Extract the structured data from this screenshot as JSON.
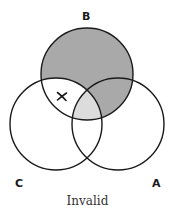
{
  "diagram": {
    "type": "venn-3-set",
    "caption": "Invalid",
    "sets": [
      {
        "id": "A",
        "label": "A",
        "cx": 118,
        "cy": 124,
        "r": 46
      },
      {
        "id": "B",
        "label": "B",
        "cx": 87,
        "cy": 74,
        "r": 46
      },
      {
        "id": "C",
        "label": "C",
        "cx": 56,
        "cy": 124,
        "r": 46
      }
    ],
    "regions": {
      "B_only": {
        "shading": "dark",
        "color": "#a9a9a9"
      },
      "A_and_B_not_C": {
        "shading": "dark",
        "color": "#a9a9a9"
      },
      "A_and_B_and_C": {
        "shading": "light",
        "color": "#dcdcdc"
      },
      "B_and_C_not_A": {
        "shading": "none",
        "mark": "X"
      }
    },
    "mark": {
      "symbol": "X",
      "x": 62,
      "y": 96
    },
    "colors": {
      "stroke": "#1a1a1a",
      "dark_fill": "#a9a9a9",
      "light_fill": "#dcdcdc",
      "background": "#ffffff"
    }
  }
}
